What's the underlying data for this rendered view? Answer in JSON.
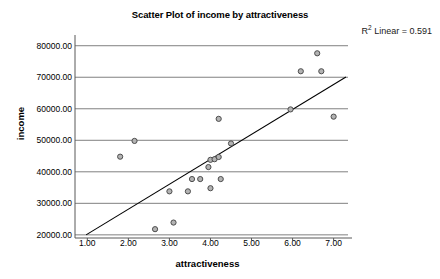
{
  "chart_data": {
    "type": "scatter",
    "title": "Scatter Plot of income by attractiveness",
    "xlabel": "attractiveness",
    "ylabel": "income",
    "annotation": "R² Linear = 0.591",
    "annotation_prefix": "R",
    "annotation_sup": "2",
    "annotation_suffix": " Linear = 0.591",
    "r_squared": 0.591,
    "grid": "horizontal",
    "legend": "none",
    "xlim": [
      0.7,
      7.35
    ],
    "ylim": [
      19000,
      81500
    ],
    "xticks": [
      "1.00",
      "2.00",
      "3.00",
      "4.00",
      "5.00",
      "6.00",
      "7.00"
    ],
    "xtick_values": [
      1,
      2,
      3,
      4,
      5,
      6,
      7
    ],
    "yticks": [
      "20000.00",
      "30000.00",
      "40000.00",
      "50000.00",
      "60000.00",
      "70000.00",
      "80000.00"
    ],
    "ytick_values": [
      20000,
      30000,
      40000,
      50000,
      60000,
      70000,
      80000
    ],
    "marker": {
      "shape": "circle-open",
      "fill": "#b3b3b3",
      "stroke": "#4d4d4d",
      "radius": 2.6
    },
    "fit_line": {
      "type": "linear",
      "color": "#000000",
      "width": 1.1,
      "x_start": 0.97,
      "y_start": 20000,
      "x_end": 7.3,
      "y_end": 70100
    },
    "points": [
      {
        "x": 1.8,
        "y": 44800
      },
      {
        "x": 2.15,
        "y": 49800
      },
      {
        "x": 2.65,
        "y": 21800
      },
      {
        "x": 3.0,
        "y": 33800
      },
      {
        "x": 3.1,
        "y": 23900
      },
      {
        "x": 3.45,
        "y": 33800
      },
      {
        "x": 3.55,
        "y": 37700
      },
      {
        "x": 3.75,
        "y": 37700
      },
      {
        "x": 3.95,
        "y": 41500
      },
      {
        "x": 4.0,
        "y": 34800
      },
      {
        "x": 4.0,
        "y": 43800
      },
      {
        "x": 4.1,
        "y": 44000
      },
      {
        "x": 4.2,
        "y": 44700
      },
      {
        "x": 4.2,
        "y": 56800
      },
      {
        "x": 4.25,
        "y": 37700
      },
      {
        "x": 4.5,
        "y": 49000
      },
      {
        "x": 5.95,
        "y": 59800
      },
      {
        "x": 6.2,
        "y": 71900
      },
      {
        "x": 6.6,
        "y": 77600
      },
      {
        "x": 6.7,
        "y": 71900
      },
      {
        "x": 7.0,
        "y": 57500
      }
    ]
  }
}
